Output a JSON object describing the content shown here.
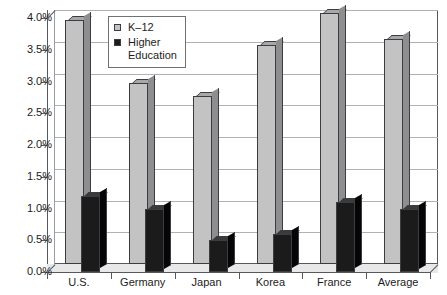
{
  "chart_data": {
    "type": "bar",
    "title": "",
    "subtitle": "",
    "xlabel": "",
    "ylabel": "",
    "categories": [
      "U.S.",
      "Germany",
      "Japan",
      "Korea",
      "France",
      "Average"
    ],
    "series": [
      {
        "name": "K–12",
        "color": "#c3c3c3",
        "values": [
          3.85,
          2.85,
          2.65,
          3.45,
          3.95,
          3.55
        ]
      },
      {
        "name": "Higher Education",
        "color": "#1b1b1b",
        "values": [
          1.2,
          1.0,
          0.5,
          0.6,
          1.1,
          1.0
        ]
      }
    ],
    "ylim": [
      0,
      4.0
    ],
    "ytick_values": [
      0,
      0.5,
      1.0,
      1.5,
      2.0,
      2.5,
      3.0,
      3.5,
      4.0
    ],
    "ytick_labels": [
      "0.0%",
      "0.5%",
      "1.0%",
      "1.5%",
      "2.0%",
      "2.5%",
      "3.0%",
      "3.5%",
      "4.0%"
    ],
    "grid": true,
    "legend_position": "upper-left-inside",
    "style": "3d-column"
  },
  "legend": {
    "entries": [
      {
        "label": "K–12",
        "line2": ""
      },
      {
        "label": "Higher",
        "line2": "Education"
      }
    ]
  }
}
